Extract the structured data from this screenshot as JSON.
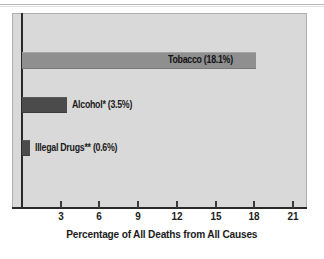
{
  "chart_data": {
    "type": "bar",
    "orientation": "horizontal",
    "title": "",
    "xlabel": "Percentage of All Deaths from All Causes",
    "ylabel": "",
    "xlim": [
      0,
      21
    ],
    "xticks": [
      "3",
      "6",
      "9",
      "12",
      "15",
      "18",
      "21"
    ],
    "xtick_values": [
      3,
      6,
      9,
      12,
      15,
      18,
      21
    ],
    "grid": false,
    "legend": "none",
    "categories": [
      "Tobacco",
      "Alcohol*",
      "Illegal Drugs**"
    ],
    "values": [
      18.1,
      3.5,
      0.6
    ],
    "bars": [
      {
        "category": "Tobacco",
        "value": 18.1,
        "label": "Tobacco (18.1%)",
        "label_position": "inside-right",
        "color": "#8f8f8f"
      },
      {
        "category": "Alcohol*",
        "value": 3.5,
        "label": "Alcohol* (3.5%)",
        "label_position": "outside-right",
        "color": "#4b4b4b"
      },
      {
        "category": "Illegal Drugs**",
        "value": 0.6,
        "label": "Illegal Drugs** (0.6%)",
        "label_position": "outside-right",
        "color": "#4b4b4b"
      }
    ],
    "colors": {
      "panel_background": "#d9d9d9",
      "axis": "#2a2a2a",
      "text": "#1c1c1c",
      "bar_light": "#8f8f8f",
      "bar_dark": "#4b4b4b"
    }
  }
}
